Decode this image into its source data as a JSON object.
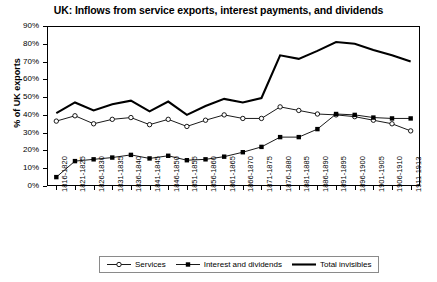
{
  "chart_data": {
    "type": "line",
    "title": "UK: Inflows from service exports, interest payments, and dividends",
    "xlabel": "",
    "ylabel": "% of UK exports",
    "ylim": [
      0,
      90
    ],
    "ytick_labels": [
      "0%",
      "10%",
      "20%",
      "30%",
      "40%",
      "50%",
      "60%",
      "70%",
      "80%",
      "90%"
    ],
    "ytick_values": [
      0,
      10,
      20,
      30,
      40,
      50,
      60,
      70,
      80,
      90
    ],
    "grid": true,
    "legend_position": "bottom",
    "categories": [
      "1816-1820",
      "1821-1825",
      "1826-1830",
      "1831-1835",
      "1836-1840",
      "1841-1845",
      "1846-1850",
      "1851-1855",
      "1856-1860",
      "1861-1865",
      "1866-1870",
      "1871-1875",
      "1876-1880",
      "1881-1885",
      "1886-1890",
      "1891-1895",
      "1896-1900",
      "1901-1905",
      "1906-1910",
      "1911-1913"
    ],
    "series": [
      {
        "name": "Services",
        "marker": "open-circle",
        "values": [
          36.5,
          39.5,
          35.0,
          37.5,
          38.5,
          34.5,
          37.5,
          33.5,
          37.0,
          40.0,
          38.0,
          38.0,
          44.5,
          42.5,
          40.5,
          40.0,
          39.0,
          37.0,
          35.0,
          31.0
        ]
      },
      {
        "name": "Interest and dividends",
        "marker": "filled-square",
        "values": [
          5.0,
          14.0,
          15.0,
          16.0,
          17.5,
          15.5,
          17.0,
          14.5,
          15.0,
          16.5,
          19.0,
          22.0,
          27.5,
          27.5,
          32.0,
          40.5,
          40.0,
          38.5,
          38.0,
          38.0
        ]
      },
      {
        "name": "Total invisibles",
        "marker": "none",
        "values": [
          41.0,
          47.0,
          42.5,
          46.0,
          48.0,
          42.0,
          47.5,
          40.0,
          45.0,
          49.0,
          47.0,
          49.5,
          73.5,
          71.5,
          76.0,
          81.0,
          80.0,
          76.5,
          73.5,
          70.0
        ]
      }
    ]
  },
  "legend": {
    "items": [
      {
        "label": "Services"
      },
      {
        "label": "Interest and dividends"
      },
      {
        "label": "Total invisibles"
      }
    ]
  }
}
